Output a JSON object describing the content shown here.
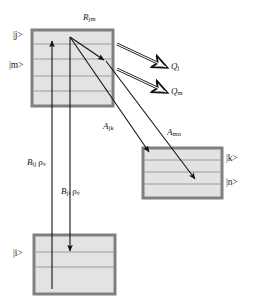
{
  "diagram": {
    "colors": {
      "box_fill": "#e3e3e3",
      "box_border": "#808080",
      "sublevel_line": "#9a9a9a",
      "arrow": "#111111",
      "text": "#1a1a1a",
      "background": "#ffffff"
    },
    "boxes": [
      {
        "id": "upper-manifold",
        "x": 32,
        "y": 30,
        "w": 81,
        "h": 76,
        "sublevels": [
          14,
          29,
          46,
          61
        ],
        "top_label": "R",
        "top_label_sub": "jm"
      },
      {
        "id": "right-manifold",
        "x": 143,
        "y": 148,
        "w": 79,
        "h": 50,
        "sublevels": [
          12,
          24,
          36
        ]
      },
      {
        "id": "lower-manifold",
        "x": 34,
        "y": 235,
        "w": 81,
        "h": 59,
        "sublevels": [
          17,
          32
        ]
      }
    ],
    "state_labels": [
      {
        "id": "ket-j",
        "text": "|j>",
        "x": 13,
        "y": 31
      },
      {
        "id": "ket-m",
        "text": "|m>",
        "x": 10,
        "y": 61
      },
      {
        "id": "ket-k",
        "text": "|k>",
        "x": 226,
        "y": 155
      },
      {
        "id": "ket-n",
        "text": "|n>",
        "x": 226,
        "y": 179
      },
      {
        "id": "ket-i",
        "text": "|i>",
        "x": 13,
        "y": 250
      }
    ],
    "rate_labels": [
      {
        "id": "R-jm",
        "base": "R",
        "sub": "jm",
        "x": 83,
        "y": 15
      },
      {
        "id": "Q-j",
        "base": "Q",
        "sub": "j",
        "x": 172,
        "y": 64
      },
      {
        "id": "Q-m",
        "base": "Q",
        "sub": "m",
        "x": 172,
        "y": 89
      },
      {
        "id": "A-jk",
        "base": "A",
        "sub": "jk",
        "x": 104,
        "y": 124
      },
      {
        "id": "A-mn",
        "base": "A",
        "sub": "mn",
        "x": 168,
        "y": 130
      },
      {
        "id": "B-ij",
        "base": "B",
        "sub": "ij",
        "rho": "ρ",
        "rho_sub": "v",
        "x": 28,
        "y": 160
      },
      {
        "id": "B-ji",
        "base": "B",
        "sub": "ji",
        "rho": "ρ",
        "rho_sub": "v",
        "x": 62,
        "y": 189
      }
    ],
    "arrows": [
      {
        "id": "absorption-B-ij",
        "style": "solid",
        "from": [
          52,
          289
        ],
        "to": [
          52,
          40
        ],
        "desc": "upward pump from lower manifold to |j>"
      },
      {
        "id": "stimulated-emission-B-ji",
        "style": "solid",
        "from": [
          70,
          37
        ],
        "to": [
          70,
          252
        ],
        "desc": "downward stimulated emission to lower manifold"
      },
      {
        "id": "quench-Q-j",
        "style": "hollow",
        "from": [
          116,
          44
        ],
        "to": [
          168,
          68
        ],
        "desc": "quenching loss from |j>"
      },
      {
        "id": "quench-Q-m",
        "style": "hollow",
        "from": [
          116,
          69
        ],
        "to": [
          168,
          93
        ],
        "desc": "quenching loss from |m>"
      },
      {
        "id": "transfer-R-jm",
        "style": "solid",
        "from": [
          70,
          37
        ],
        "to": [
          106,
          61
        ],
        "desc": "collisional transfer |j> to |m>"
      },
      {
        "id": "spontaneous-A-jk",
        "style": "solid",
        "from": [
          70,
          37
        ],
        "to": [
          150,
          153
        ],
        "desc": "spontaneous emission |j> to |k>"
      },
      {
        "id": "spontaneous-A-mn",
        "style": "solid",
        "from": [
          106,
          61
        ],
        "to": [
          196,
          180
        ],
        "desc": "spontaneous emission |m> to |n>"
      }
    ]
  }
}
